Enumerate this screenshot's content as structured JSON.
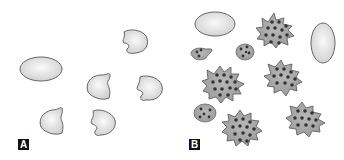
{
  "panels": [
    {
      "label": "A",
      "description": "Resting cells"
    },
    {
      "label": "B",
      "description": "Activated cells with granules"
    }
  ],
  "colors": {
    "cell_fill_light": "#e8e8e8",
    "cell_fill_activated": "#a9a9a9",
    "cell_outline": "#5a5a5a",
    "granule": "#333333",
    "label_bg": "#111111",
    "label_fg": "#ffffff"
  }
}
